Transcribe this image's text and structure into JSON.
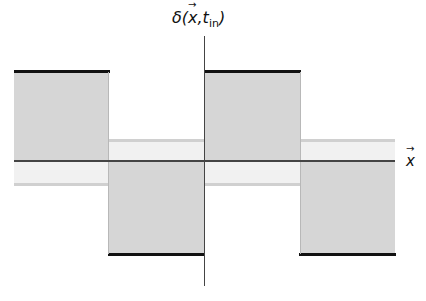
{
  "figure": {
    "y_axis_label": "δ(x⃗, t_in)",
    "y_axis_label_parts": {
      "main": "δ(",
      "vec": "x",
      "sep": ",",
      "t": "t",
      "sub": "in",
      "close": ")"
    },
    "x_axis_label": "x",
    "x_axis_label_vec": "→"
  },
  "segments": [
    {
      "name": "segment-1",
      "sign": "positive"
    },
    {
      "name": "segment-2",
      "sign": "negative"
    },
    {
      "name": "segment-3",
      "sign": "positive"
    },
    {
      "name": "segment-4",
      "sign": "negative"
    }
  ],
  "colors": {
    "fill_dark": "#d6d6d6",
    "fill_light": "#f1f1f1",
    "line": "#111111",
    "axis": "#444444"
  }
}
